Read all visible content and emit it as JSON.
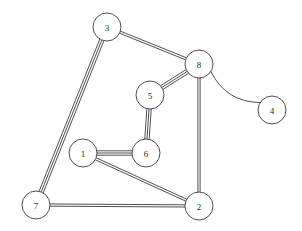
{
  "diagram": {
    "type": "multigraph",
    "canvas": {
      "width": 302,
      "height": 231,
      "background": "#ffffff"
    },
    "style": {
      "edge_color": "#3b3b3b",
      "node_stroke": "#3b3b3b",
      "node_fill": "#ffffff",
      "label_color": "#2a2a2a",
      "stroke_width": 0.9,
      "node_radius": 14,
      "parallel_edge_gap": 2.2
    },
    "nodes": [
      {
        "id": "1",
        "label": "1",
        "x": 83,
        "y": 153,
        "r": 14
      },
      {
        "id": "2",
        "label": "2",
        "x": 199,
        "y": 206,
        "r": 14
      },
      {
        "id": "3",
        "label": "3",
        "x": 107,
        "y": 27,
        "r": 14
      },
      {
        "id": "4",
        "label": "4",
        "x": 272,
        "y": 110,
        "r": 14
      },
      {
        "id": "5",
        "label": "5",
        "x": 150,
        "y": 95,
        "r": 14
      },
      {
        "id": "6",
        "label": "6",
        "x": 146,
        "y": 153,
        "r": 14
      },
      {
        "id": "7",
        "label": "7",
        "x": 36,
        "y": 205,
        "r": 14
      },
      {
        "id": "8",
        "label": "8",
        "x": 199,
        "y": 64,
        "r": 14
      }
    ],
    "edges": [
      {
        "source": "3",
        "target": "8",
        "multiplicity": 2,
        "shape": "straight"
      },
      {
        "source": "3",
        "target": "7",
        "multiplicity": 3,
        "shape": "straight"
      },
      {
        "source": "5",
        "target": "8",
        "multiplicity": 3,
        "shape": "straight"
      },
      {
        "source": "5",
        "target": "6",
        "multiplicity": 3,
        "shape": "straight"
      },
      {
        "source": "1",
        "target": "6",
        "multiplicity": 3,
        "shape": "straight"
      },
      {
        "source": "1",
        "target": "2",
        "multiplicity": 2,
        "shape": "straight"
      },
      {
        "source": "7",
        "target": "2",
        "multiplicity": 2,
        "shape": "straight"
      },
      {
        "source": "8",
        "target": "2",
        "multiplicity": 2,
        "shape": "straight"
      },
      {
        "source": "8",
        "target": "4",
        "multiplicity": 1,
        "shape": "curved",
        "curvature": 18
      }
    ]
  }
}
